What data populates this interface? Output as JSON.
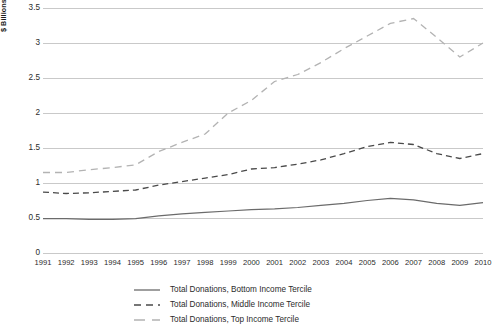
{
  "chart_data": {
    "type": "line",
    "title": "",
    "xlabel": "",
    "ylabel": "$ Billions (Base Year: 2000)",
    "grid": true,
    "legend_position": "bottom",
    "ylim": [
      0,
      3.5
    ],
    "yticks": [
      "0",
      "0.5",
      "1",
      "1.5",
      "2",
      "2.5",
      "3",
      "3.5"
    ],
    "ytick_values": [
      0,
      0.5,
      1,
      1.5,
      2,
      2.5,
      3,
      3.5
    ],
    "categories": [
      "1991",
      "1992",
      "1993",
      "1994",
      "1995",
      "1996",
      "1997",
      "1998",
      "1999",
      "2000",
      "2001",
      "2002",
      "2003",
      "2004",
      "2005",
      "2006",
      "2007",
      "2008",
      "2009",
      "2010"
    ],
    "series": [
      {
        "name": "Total Donations, Bottom Income Tercile",
        "style": "solid",
        "color": "#6b6b6b",
        "values": [
          0.49,
          0.49,
          0.48,
          0.48,
          0.49,
          0.53,
          0.56,
          0.58,
          0.6,
          0.62,
          0.63,
          0.65,
          0.68,
          0.71,
          0.75,
          0.78,
          0.76,
          0.71,
          0.68,
          0.72
        ]
      },
      {
        "name": "Total Donations, Middle Income Tercile",
        "style": "dashed",
        "color": "#4a4a4a",
        "values": [
          0.87,
          0.85,
          0.86,
          0.88,
          0.9,
          0.97,
          1.02,
          1.07,
          1.12,
          1.2,
          1.22,
          1.27,
          1.33,
          1.42,
          1.52,
          1.58,
          1.55,
          1.42,
          1.35,
          1.42
        ]
      },
      {
        "name": "Total Donations, Top Income Tercile",
        "style": "longdash",
        "color": "#b3b3b3",
        "values": [
          1.15,
          1.15,
          1.19,
          1.22,
          1.26,
          1.45,
          1.58,
          1.7,
          2.0,
          2.18,
          2.45,
          2.55,
          2.72,
          2.92,
          3.1,
          3.28,
          3.35,
          3.08,
          2.8,
          3.0
        ]
      }
    ]
  },
  "legend": {
    "items": [
      {
        "label": "Total Donations, Bottom Income Tercile"
      },
      {
        "label": "Total Donations, Middle Income Tercile"
      },
      {
        "label": "Total Donations, Top Income Tercile"
      }
    ]
  }
}
